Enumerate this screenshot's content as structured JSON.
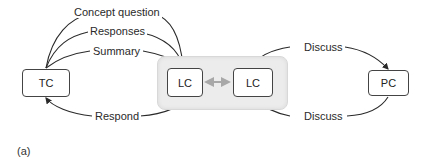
{
  "nodes": {
    "tc": "TC",
    "lc_left": "LC",
    "lc_right": "LC",
    "pc": "PC"
  },
  "edges": {
    "concept_question": "Concept question",
    "responses": "Responses",
    "summary": "Summary",
    "respond": "Respond",
    "discuss_top": "Discuss",
    "discuss_bottom": "Discuss"
  },
  "caption": "(a)",
  "colors": {
    "line": "#2a2a2a",
    "group_fill": "#ececec",
    "bidirectional_arrow": "#a8a8a8"
  }
}
